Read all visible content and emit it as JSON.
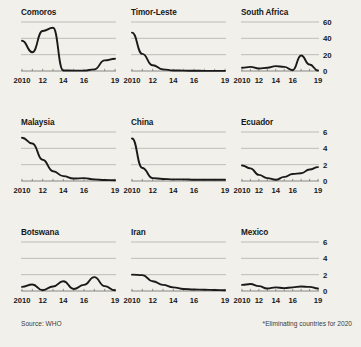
{
  "footer": {
    "source": "Source: WHO",
    "note": "*Eliminating countries for 2020"
  },
  "axis": {
    "x_ticks": [
      "2010",
      "12",
      "14",
      "16",
      "19"
    ],
    "x_tick_years": [
      2010,
      2012,
      2014,
      2016,
      2019
    ],
    "y_ticks_large": [
      "60",
      "40",
      "20",
      "0"
    ],
    "y_ticks_small": [
      "6",
      "4",
      "2",
      "0"
    ]
  },
  "colors": {
    "background": "#f2f0ea",
    "line": "#1a1a1a",
    "gridline": "#a9a8a4",
    "axis": "#6e6d6a",
    "text": "#16181a",
    "footer_text": "#3a3c3e"
  },
  "titles": {
    "comoros": "Comoros",
    "timor_leste": "Timor-Leste",
    "south_africa": "South Africa",
    "malaysia": "Malaysia",
    "china": "China",
    "ecuador": "Ecuador",
    "botswana": "Botswana",
    "iran": "Iran",
    "mexico": "Mexico"
  },
  "chart_data": [
    {
      "type": "line",
      "title": "Comoros",
      "row": 0,
      "col": 0,
      "xlabel": "",
      "ylabel": "",
      "xlim": [
        2010,
        2019
      ],
      "ylim": [
        0,
        60
      ],
      "yticks": [
        0,
        20,
        40,
        60
      ],
      "grid": true,
      "x": [
        2010,
        2011,
        2012,
        2013,
        2014,
        2015,
        2016,
        2017,
        2018,
        2019
      ],
      "values": [
        37,
        23,
        49,
        53,
        0.6,
        0.5,
        0.5,
        2,
        13,
        15
      ]
    },
    {
      "type": "line",
      "title": "Timor-Leste",
      "row": 0,
      "col": 1,
      "xlabel": "",
      "ylabel": "",
      "xlim": [
        2010,
        2019
      ],
      "ylim": [
        0,
        60
      ],
      "yticks": [
        0,
        20,
        40,
        60
      ],
      "grid": true,
      "x": [
        2010,
        2011,
        2012,
        2013,
        2014,
        2015,
        2016,
        2017,
        2018,
        2019
      ],
      "values": [
        47,
        21,
        7,
        2,
        0.7,
        0.4,
        0.3,
        0.2,
        0.2,
        0.2
      ]
    },
    {
      "type": "line",
      "title": "South Africa",
      "row": 0,
      "col": 2,
      "xlabel": "",
      "ylabel": "",
      "xlim": [
        2010,
        2019
      ],
      "ylim": [
        0,
        60
      ],
      "yticks": [
        0,
        20,
        40,
        60
      ],
      "grid": true,
      "x": [
        2010,
        2011,
        2012,
        2013,
        2014,
        2015,
        2016,
        2017,
        2018,
        2019
      ],
      "values": [
        4,
        5,
        3,
        4,
        6,
        5,
        1,
        19,
        8,
        0.5
      ]
    },
    {
      "type": "line",
      "title": "Malaysia",
      "row": 1,
      "col": 0,
      "xlabel": "",
      "ylabel": "",
      "xlim": [
        2010,
        2019
      ],
      "ylim": [
        0,
        6
      ],
      "yticks": [
        0,
        2,
        4,
        6
      ],
      "grid": true,
      "x": [
        2010,
        2011,
        2012,
        2013,
        2014,
        2015,
        2016,
        2017,
        2018,
        2019
      ],
      "values": [
        5.3,
        4.6,
        2.6,
        1.2,
        0.6,
        0.3,
        0.35,
        0.2,
        0.12,
        0.1
      ]
    },
    {
      "type": "line",
      "title": "China",
      "row": 1,
      "col": 1,
      "xlabel": "",
      "ylabel": "",
      "xlim": [
        2010,
        2019
      ],
      "ylim": [
        0,
        6
      ],
      "yticks": [
        0,
        2,
        4,
        6
      ],
      "grid": true,
      "x": [
        2010,
        2011,
        2012,
        2013,
        2014,
        2015,
        2016,
        2017,
        2018,
        2019
      ],
      "values": [
        5.2,
        1.6,
        0.35,
        0.25,
        0.2,
        0.2,
        0.15,
        0.15,
        0.15,
        0.15
      ]
    },
    {
      "type": "line",
      "title": "Ecuador",
      "row": 1,
      "col": 2,
      "xlabel": "",
      "ylabel": "",
      "xlim": [
        2010,
        2019
      ],
      "ylim": [
        0,
        6
      ],
      "yticks": [
        0,
        2,
        4,
        6
      ],
      "grid": true,
      "x": [
        2010,
        2011,
        2012,
        2013,
        2014,
        2015,
        2016,
        2017,
        2018,
        2019
      ],
      "values": [
        1.9,
        1.55,
        0.75,
        0.35,
        0.15,
        0.5,
        0.85,
        0.95,
        1.4,
        1.7
      ]
    },
    {
      "type": "line",
      "title": "Botswana",
      "row": 2,
      "col": 0,
      "xlabel": "",
      "ylabel": "",
      "xlim": [
        2010,
        2019
      ],
      "ylim": [
        0,
        6
      ],
      "yticks": [
        0,
        2,
        4,
        6
      ],
      "grid": true,
      "x": [
        2010,
        2011,
        2012,
        2013,
        2014,
        2015,
        2016,
        2017,
        2018,
        2019
      ],
      "values": [
        0.5,
        0.8,
        0.1,
        0.55,
        1.2,
        0.25,
        0.75,
        1.7,
        0.6,
        0.1
      ]
    },
    {
      "type": "line",
      "title": "Iran",
      "row": 2,
      "col": 1,
      "xlabel": "",
      "ylabel": "",
      "xlim": [
        2010,
        2019
      ],
      "ylim": [
        0,
        6
      ],
      "yticks": [
        0,
        2,
        4,
        6
      ],
      "grid": true,
      "x": [
        2010,
        2011,
        2012,
        2013,
        2014,
        2015,
        2016,
        2017,
        2018,
        2019
      ],
      "values": [
        2.0,
        1.95,
        1.2,
        0.75,
        0.45,
        0.25,
        0.18,
        0.15,
        0.12,
        0.1
      ]
    },
    {
      "type": "line",
      "title": "Mexico",
      "row": 2,
      "col": 2,
      "xlabel": "",
      "ylabel": "",
      "xlim": [
        2010,
        2019
      ],
      "ylim": [
        0,
        6
      ],
      "yticks": [
        0,
        2,
        4,
        6
      ],
      "grid": true,
      "x": [
        2010,
        2011,
        2012,
        2013,
        2014,
        2015,
        2016,
        2017,
        2018,
        2019
      ],
      "values": [
        0.75,
        0.85,
        0.6,
        0.3,
        0.45,
        0.35,
        0.45,
        0.55,
        0.5,
        0.3
      ]
    }
  ]
}
